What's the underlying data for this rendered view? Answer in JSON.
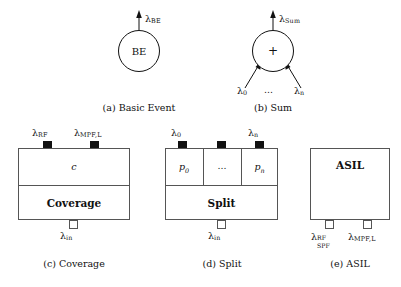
{
  "figure": {
    "subfigures": [
      {
        "id": "a",
        "caption": "(a) Basic Event",
        "node_label": "BE",
        "shape": "circle",
        "output_label": {
          "symbol": "λ",
          "sub": "BE"
        }
      },
      {
        "id": "b",
        "caption": "(b) Sum",
        "node_label": "+",
        "shape": "circle",
        "output_label": {
          "symbol": "λ",
          "sub": "Sum"
        },
        "input_labels": [
          {
            "symbol": "λ",
            "sub": "0"
          },
          {
            "symbol": "…"
          },
          {
            "symbol": "λ",
            "sub": "n"
          }
        ]
      },
      {
        "id": "c",
        "caption": "(c) Coverage",
        "shape": "box",
        "upper_cells": [
          "c"
        ],
        "name_label": "Coverage",
        "top_ports": [
          {
            "fill": "black",
            "label": {
              "symbol": "λ",
              "sub": "RF"
            }
          },
          {
            "fill": "black",
            "label": {
              "symbol": "λ",
              "sub": "MPF,L"
            }
          }
        ],
        "bottom_ports": [
          {
            "fill": "white",
            "label": {
              "symbol": "λ",
              "sub": "in"
            }
          }
        ]
      },
      {
        "id": "d",
        "caption": "(d) Split",
        "shape": "box",
        "upper_cells": [
          "p0",
          "…",
          "pn"
        ],
        "name_label": "Split",
        "top_ports": [
          {
            "fill": "black",
            "label": {
              "symbol": "λ",
              "sub": "0"
            }
          },
          {
            "fill": "black",
            "label": null
          },
          {
            "fill": "black",
            "label": {
              "symbol": "λ",
              "sub": "n"
            }
          }
        ],
        "bottom_ports": [
          {
            "fill": "white",
            "label": {
              "symbol": "λ",
              "sub": "in"
            }
          }
        ]
      },
      {
        "id": "e",
        "caption": "(e) ASIL",
        "shape": "box",
        "name_label": "ASIL",
        "top_ports": [],
        "bottom_ports": [
          {
            "fill": "white",
            "label": {
              "symbol": "λ",
              "sup": "RF",
              "sub": "SPF"
            }
          },
          {
            "fill": "white",
            "label": {
              "symbol": "λ",
              "sub": "MPF,L"
            }
          }
        ]
      }
    ],
    "colors": {
      "stroke": "#555555",
      "node_stroke": "#111111",
      "port_fill": "#111111",
      "text": "#111111",
      "background": "#ffffff"
    }
  }
}
